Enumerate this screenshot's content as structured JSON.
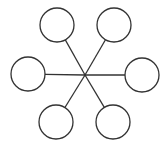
{
  "diagram": {
    "type": "star-network",
    "width": 166,
    "height": 142,
    "stroke_color": "#333333",
    "fill_color": "#ffffff",
    "background": "#ffffff",
    "hub": {
      "x": 85,
      "y": 75
    },
    "node_radius": 17,
    "nodes": [
      {
        "id": "top-left",
        "x": 57,
        "y": 25
      },
      {
        "id": "top-right",
        "x": 114,
        "y": 25
      },
      {
        "id": "left",
        "x": 28,
        "y": 74
      },
      {
        "id": "right",
        "x": 142,
        "y": 75
      },
      {
        "id": "bottom-left",
        "x": 56,
        "y": 122
      },
      {
        "id": "bottom-right",
        "x": 113,
        "y": 122
      }
    ]
  }
}
